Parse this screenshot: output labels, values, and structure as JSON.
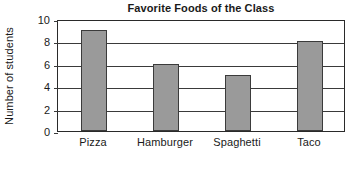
{
  "chart_data": {
    "type": "bar",
    "title": "Favorite Foods of the Class",
    "xlabel": "",
    "ylabel": "Number of students",
    "categories": [
      "Pizza",
      "Hamburger",
      "Spaghetti",
      "Taco"
    ],
    "values": [
      9,
      6,
      5,
      8
    ],
    "ylim": [
      0,
      10
    ],
    "yticks": [
      0,
      2,
      4,
      6,
      8,
      10
    ],
    "ytick_labels": [
      "0",
      "2",
      "4",
      "6",
      "8",
      "10"
    ],
    "grid": "horizontal",
    "legend": "none",
    "bar_fill_color": "#9a9a9a",
    "bar_edge_color": "#3b3b3b",
    "axis_color": "#2a2a2a",
    "text_color": "#1a1a1a",
    "background_color": "#ffffff"
  }
}
